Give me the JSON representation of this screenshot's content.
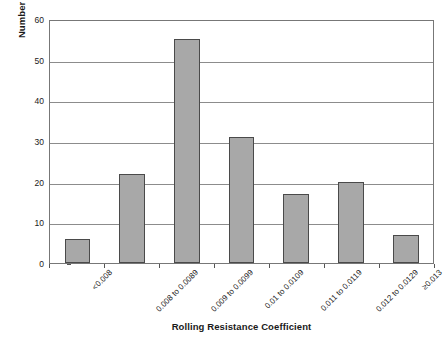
{
  "chart_data": {
    "type": "bar",
    "title": "",
    "xlabel": "Rolling Resistance Coefficient",
    "ylabel": "Number of Tires",
    "categories": [
      "<0.008",
      "0.008 to 0.0089",
      "0.009 to 0.0099",
      "0.01 to 0.0109",
      "0.011 to 0.0119",
      "0.012 to 0.0129",
      "≥0.013"
    ],
    "values": [
      6,
      22,
      55,
      31,
      17,
      20,
      7
    ],
    "ylim": [
      0,
      60
    ],
    "yticks": [
      0,
      10,
      20,
      30,
      40,
      50,
      60
    ],
    "ytick_labels": [
      "0",
      "10",
      "20",
      "30",
      "40",
      "50",
      "60"
    ],
    "grid": true,
    "legend": false,
    "bar_color": "#a8a8a8",
    "bar_border_color": "#4a4a4a",
    "gridline_color": "#8c8c8c",
    "axis_color": "#777777"
  }
}
